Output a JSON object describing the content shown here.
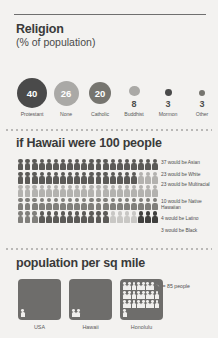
{
  "religion": {
    "title": "Religion",
    "subtitle": "(% of population)",
    "items": [
      {
        "label": "Protestant",
        "value": "40",
        "size": 30,
        "color": "#4a4a4a",
        "value_inside": true
      },
      {
        "label": "None",
        "value": "26",
        "size": 25,
        "color": "#aaa9a6",
        "value_inside": true
      },
      {
        "label": "Catholic",
        "value": "20",
        "size": 22,
        "color": "#76756f",
        "value_inside": true
      },
      {
        "label": "Buddhist",
        "value": "8",
        "size": 11,
        "color": "#aaa9a6",
        "value_inside": false
      },
      {
        "label": "Mormon",
        "value": "3",
        "size": 7,
        "color": "#4a4a4a",
        "value_inside": false
      },
      {
        "label": "Other",
        "value": "3",
        "size": 6,
        "color": "#76756f",
        "value_inside": false
      }
    ]
  },
  "hundred_people": {
    "title": "if Hawaii were 100 people",
    "total": 100,
    "per_row": 20,
    "groups": [
      {
        "name": "Asian",
        "count": 37,
        "color": "#5b5a57",
        "legend": "37 would be Asian"
      },
      {
        "name": "White",
        "count": 23,
        "color": "#b3b2af",
        "legend": "23 would be White"
      },
      {
        "name": "Multiracial",
        "count": 23,
        "color": "#807f7b",
        "legend": "23 would be Multiracial"
      },
      {
        "name": "Native Hawaiian",
        "count": 10,
        "color": "#5b5a57",
        "legend": "10 would be Native Hawaiian"
      },
      {
        "name": "Latino",
        "count": 4,
        "color": "#c8c7c4",
        "legend": "4 would be Latino"
      },
      {
        "name": "Black",
        "count": 3,
        "color": "#3f3f3d",
        "legend": "3 would be Black"
      }
    ]
  },
  "population_density": {
    "title": "population per sq mile",
    "key_label": "= 85 people",
    "key_unit": 85,
    "places": [
      {
        "label": "USA",
        "icons": 1
      },
      {
        "label": "Hawaii",
        "icons": 2
      },
      {
        "label": "Honolulu",
        "icons": 25
      }
    ]
  },
  "chart_data": {
    "type": "bar",
    "charts": [
      {
        "type": "pie",
        "title": "Religion (% of population)",
        "categories": [
          "Protestant",
          "None",
          "Catholic",
          "Buddhist",
          "Mormon",
          "Other"
        ],
        "values": [
          40,
          26,
          20,
          8,
          3,
          3
        ],
        "ylabel": "% of population"
      },
      {
        "type": "bar",
        "title": "if Hawaii were 100 people",
        "categories": [
          "Asian",
          "White",
          "Multiracial",
          "Native Hawaiian",
          "Latino",
          "Black"
        ],
        "values": [
          37,
          23,
          23,
          10,
          4,
          3
        ],
        "ylabel": "people per 100"
      },
      {
        "type": "bar",
        "title": "population per sq mile",
        "categories": [
          "USA",
          "Hawaii",
          "Honolulu"
        ],
        "values": [
          85,
          170,
          2125
        ],
        "ylabel": "people per sq mile"
      }
    ]
  }
}
